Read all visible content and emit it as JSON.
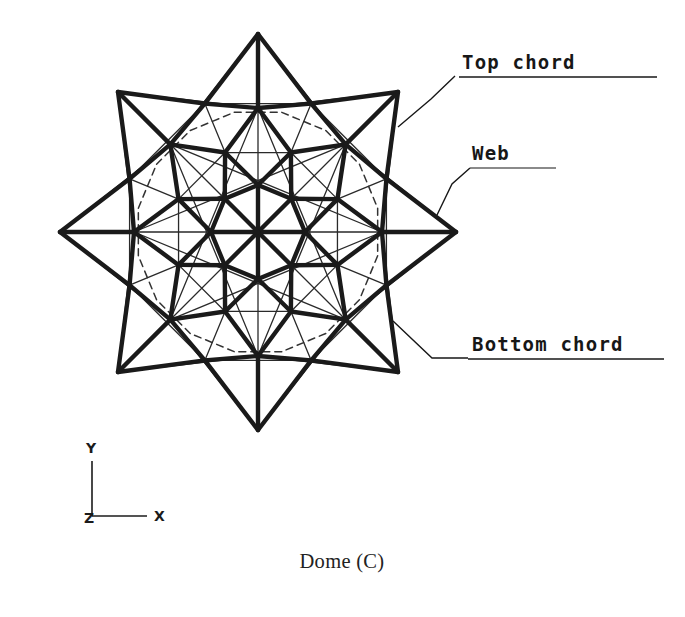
{
  "figure": {
    "caption": "Dome (C)",
    "kind": "structural-plan-view"
  },
  "callouts": [
    {
      "id": "top-chord",
      "label": "Top chord",
      "underlined": true,
      "text_x": 462,
      "text_y": 69,
      "underline": {
        "x1": 459,
        "y1": 77,
        "x2": 657,
        "y2": 77
      },
      "leader": "M 455 76 L 431 99 L 398 127"
    },
    {
      "id": "web",
      "label": "Web",
      "underlined": false,
      "text_x": 472,
      "text_y": 160,
      "underline": {
        "x1": 470,
        "y1": 168,
        "x2": 556,
        "y2": 168
      },
      "leader": "M 470 168 L 452 184 L 437 215"
    },
    {
      "id": "bottom-chord",
      "label": "Bottom chord",
      "underlined": true,
      "text_x": 472,
      "text_y": 351,
      "underline": {
        "x1": 468,
        "y1": 359,
        "x2": 664,
        "y2": 359
      },
      "leader": "M 468 358 L 432 358 L 393 321"
    }
  ],
  "axis_triad": {
    "origin": {
      "x": 92,
      "y": 516
    },
    "y_tip": {
      "x": 92,
      "y": 461
    },
    "x_tip": {
      "x": 147,
      "y": 516
    },
    "labels": {
      "y": "Y",
      "x": "X",
      "z": "Z"
    },
    "y_label_pos": {
      "x": 86,
      "y": 453
    },
    "x_label_pos": {
      "x": 154,
      "y": 521
    },
    "z_label_pos": {
      "x": 84,
      "y": 523
    }
  },
  "geometry": {
    "center": {
      "x": 258,
      "y": 232
    },
    "symmetry": 8,
    "rings": [
      {
        "name": "hub",
        "radius": 0,
        "count": 1,
        "phase": 0
      },
      {
        "name": "ring-1",
        "radius": 47,
        "count": 8,
        "phase": 0
      },
      {
        "name": "ring-2",
        "radius": 86,
        "count": 8,
        "phase": 22.5
      },
      {
        "name": "ring-3",
        "radius": 124,
        "count": 8,
        "phase": 0
      },
      {
        "name": "ring-inner-valley",
        "radius": 131,
        "count": 8,
        "phase": 22.5
      },
      {
        "name": "star-valley",
        "radius": 139,
        "count": 8,
        "phase": 22.5
      },
      {
        "name": "star-tip",
        "radius": 198,
        "count": 8,
        "phase": 0
      }
    ],
    "bottom_chord_ring_radius": 122,
    "stroke_widths": {
      "top_chord": 4.4,
      "web": 1.3,
      "bottom_chord": 1.5,
      "leader": 1.4
    },
    "colors": {
      "ink": "#171717",
      "top_chord": "#1a1a1a",
      "web": "#2a2a2a",
      "bottom_chord": "#333333",
      "background": "#ffffff"
    },
    "dash_pattern": "7,5"
  }
}
